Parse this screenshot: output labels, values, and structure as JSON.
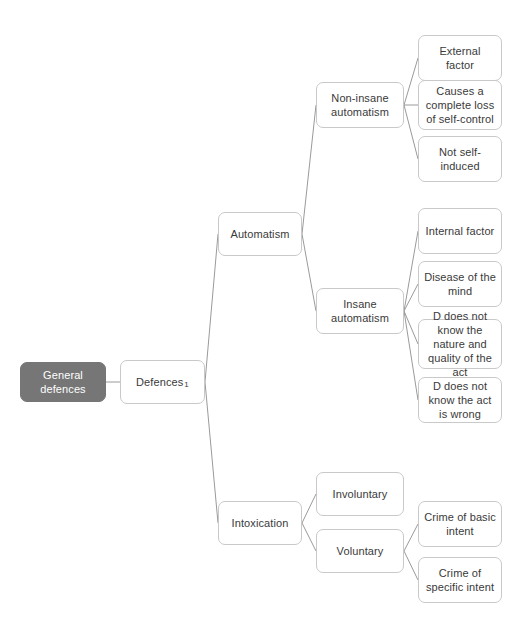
{
  "diagram": {
    "title": "General defences",
    "type": "mind-map",
    "nodes": {
      "root": {
        "label": "General defences"
      },
      "defences": {
        "label": "Defences",
        "marker": "1"
      },
      "automatism": {
        "label": "Automatism"
      },
      "non_insane": {
        "label": "Non-insane automatism"
      },
      "insane": {
        "label": "Insane automatism"
      },
      "intoxication": {
        "label": "Intoxication"
      },
      "involuntary": {
        "label": "Involuntary"
      },
      "voluntary": {
        "label": "Voluntary"
      },
      "external_factor": {
        "label": "External factor"
      },
      "complete_loss": {
        "label": "Causes a complete loss of self-control"
      },
      "not_self_induced": {
        "label": "Not self-induced"
      },
      "internal_factor": {
        "label": "Internal factor"
      },
      "disease_of_mind": {
        "label": "Disease of the mind"
      },
      "nature_quality": {
        "label": "D does not know the nature and quality of the act"
      },
      "act_is_wrong": {
        "label": "D does not know the act is wrong"
      },
      "basic_intent": {
        "label": "Crime of basic intent"
      },
      "specific_intent": {
        "label": "Crime of specific intent"
      }
    },
    "colors": {
      "root_fill": "#767676",
      "root_text": "#ffffff",
      "node_fill": "#ffffff",
      "node_border": "#c9c9c9",
      "node_text": "#3a3a3a",
      "connector": "#9a9a9a",
      "background": "#ffffff"
    }
  }
}
